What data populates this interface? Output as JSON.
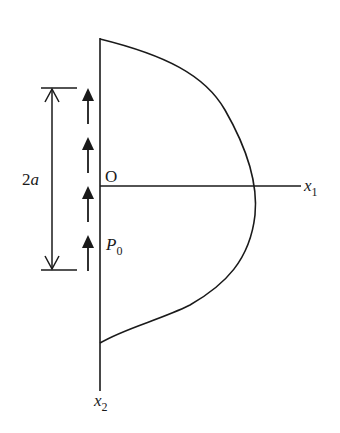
{
  "diagram": {
    "labels": {
      "origin": "O",
      "x1_axis": "x",
      "x1_sub": "1",
      "x2_axis": "x",
      "x2_sub": "2",
      "dimension": "2",
      "dimension_var": "a",
      "load_point": "P",
      "load_sub": "0"
    },
    "colors": {
      "stroke": "#1a1a1a",
      "background": "#ffffff"
    },
    "arrows": [
      {
        "x": 88,
        "head_y": 88
      },
      {
        "x": 88,
        "head_y": 137
      },
      {
        "x": 88,
        "head_y": 186
      },
      {
        "x": 88,
        "head_y": 235
      }
    ]
  }
}
